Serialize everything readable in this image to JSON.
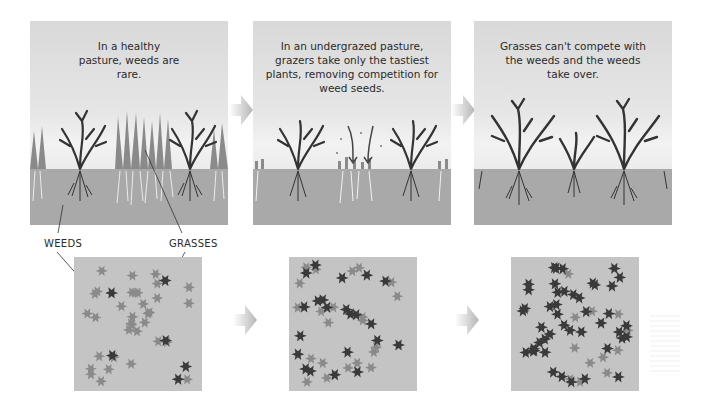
{
  "diagram": {
    "panels": [
      {
        "id": "healthy",
        "caption": "In a healthy pasture, weeds are rare."
      },
      {
        "id": "undergrazed",
        "caption": "In an undergrazed pasture, grazers take only the tastiest plants, removing competition for weed seeds."
      },
      {
        "id": "takeover",
        "caption": "Grasses can't compete with the weeds and the weeds take over."
      }
    ],
    "labels": {
      "weeds": "WEEDS",
      "grasses": "GRASSES"
    },
    "top_view_squares": [
      {
        "id": "healthy",
        "weed_count": 6,
        "grass_count": 34
      },
      {
        "id": "undergrazed",
        "weed_count": 22,
        "grass_count": 22
      },
      {
        "id": "takeover",
        "weed_count": 45,
        "grass_count": 12
      }
    ],
    "icons": {
      "flow_arrow": "arrow-right-icon",
      "weed": "weed-plant-icon",
      "grass": "grass-tuft-icon",
      "seed_fall": "arrow-down-icon"
    },
    "colors": {
      "sky": "#e6e6e6",
      "soil": "#a9a9a9",
      "weed": "#3a3a3a",
      "grass": "#8a8a8a",
      "root_grass": "#f0f0f0",
      "square_bg": "#c4c4c4",
      "arrow": "#bdbdbd",
      "text": "#2b2b2b"
    }
  }
}
